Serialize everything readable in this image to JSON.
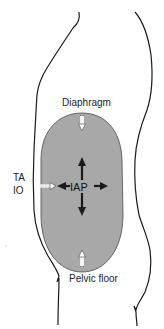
{
  "diagram": {
    "type": "anatomical-schematic",
    "labels": {
      "top": "Diaphragm",
      "bottom": "Pelvic floor",
      "left_line1": "TA",
      "left_line2": "IO",
      "center": "IAP"
    },
    "colors": {
      "cavity_fill": "#a8a8a8",
      "outline": "#1a1a1a",
      "arrow_dark": "#1a1a1a",
      "arrow_light": "#ffffff"
    },
    "arrows": {
      "outward_from_iap": [
        "up",
        "down",
        "left",
        "right"
      ],
      "inward_hollow": [
        "from-diaphragm-down",
        "from-pelvic-floor-up",
        "from-ta-io-right"
      ]
    }
  }
}
